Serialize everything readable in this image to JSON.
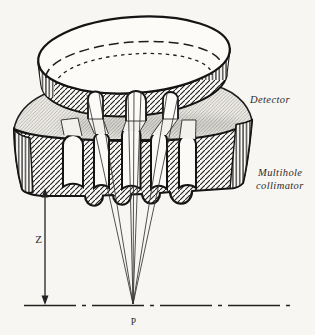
{
  "figure": {
    "labels": {
      "detector": "Detector",
      "collimator_line1": "Multihole",
      "collimator_line2": "collimator",
      "distance": "Z",
      "focal_point": "P"
    },
    "colors": {
      "paper": "#f8f6f2",
      "ink": "#1a1a1a",
      "surface_shading": "#e9e6e0"
    }
  }
}
